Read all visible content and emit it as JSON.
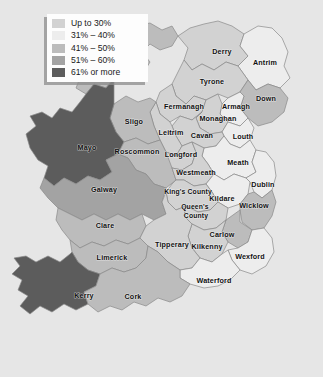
{
  "background_color": "#e6e6e6",
  "legend": {
    "box_color": "#fdfdfd",
    "shadow_color": "#8c8c8c",
    "items": [
      {
        "label": "Up to 30%",
        "color": "#d2d2d2"
      },
      {
        "label": "31% – 40%",
        "color": "#ededed"
      },
      {
        "label": "41% – 50%",
        "color": "#bcbcbc"
      },
      {
        "label": "51% – 60%",
        "color": "#a3a3a3"
      },
      {
        "label": "61% or more",
        "color": "#5c5c5c"
      }
    ]
  },
  "map": {
    "title": "Ireland county choropleth",
    "sea_color": "#e6e6e6",
    "border_color": "#8a8a8a",
    "counties": [
      {
        "name": "Donegal",
        "class": 2,
        "color": "#bcbcbc",
        "x": 92,
        "y": 59
      },
      {
        "name": "Derry",
        "class": 0,
        "color": "#d2d2d2",
        "x": 222,
        "y": 52
      },
      {
        "name": "Antrim",
        "class": 1,
        "color": "#ededed",
        "x": 265,
        "y": 63
      },
      {
        "name": "Tyrone",
        "class": 0,
        "color": "#d2d2d2",
        "x": 212,
        "y": 82
      },
      {
        "name": "Fermanagh",
        "class": 0,
        "color": "#d2d2d2",
        "x": 184,
        "y": 107
      },
      {
        "name": "Armagh",
        "class": 1,
        "color": "#ededed",
        "x": 236,
        "y": 107
      },
      {
        "name": "Down",
        "class": 2,
        "color": "#bcbcbc",
        "x": 266,
        "y": 99
      },
      {
        "name": "Monaghan",
        "class": 0,
        "color": "#d2d2d2",
        "x": 218,
        "y": 119
      },
      {
        "name": "Sligo",
        "class": 2,
        "color": "#bcbcbc",
        "x": 134,
        "y": 122
      },
      {
        "name": "Leitrim",
        "class": 0,
        "color": "#d2d2d2",
        "x": 171,
        "y": 133
      },
      {
        "name": "Cavan",
        "class": 0,
        "color": "#d2d2d2",
        "x": 202,
        "y": 136
      },
      {
        "name": "Louth",
        "class": 1,
        "color": "#ededed",
        "x": 243,
        "y": 137
      },
      {
        "name": "Mayo",
        "class": 4,
        "color": "#5c5c5c",
        "x": 87,
        "y": 148
      },
      {
        "name": "Roscommon",
        "class": 2,
        "color": "#bcbcbc",
        "x": 137,
        "y": 152
      },
      {
        "name": "Longford",
        "class": 0,
        "color": "#d2d2d2",
        "x": 181,
        "y": 155
      },
      {
        "name": "Westmeath",
        "class": 0,
        "color": "#d2d2d2",
        "x": 196,
        "y": 173
      },
      {
        "name": "Meath",
        "class": 1,
        "color": "#ededed",
        "x": 238,
        "y": 163
      },
      {
        "name": "Dublin",
        "class": 1,
        "color": "#ededed",
        "x": 263,
        "y": 185
      },
      {
        "name": "Galway",
        "class": 3,
        "color": "#a3a3a3",
        "x": 104,
        "y": 190
      },
      {
        "name": "King's County",
        "class": 0,
        "color": "#d2d2d2",
        "x": 188,
        "y": 192
      },
      {
        "name": "Kildare",
        "class": 1,
        "color": "#ededed",
        "x": 222,
        "y": 199
      },
      {
        "name": "Wicklow",
        "class": 2,
        "color": "#bcbcbc",
        "x": 254,
        "y": 206
      },
      {
        "name": "Queen's County",
        "class": 0,
        "color": "#d2d2d2",
        "x": 196,
        "y": 211
      },
      {
        "name": "Clare",
        "class": 2,
        "color": "#bcbcbc",
        "x": 105,
        "y": 226
      },
      {
        "name": "Carlow",
        "class": 2,
        "color": "#bcbcbc",
        "x": 222,
        "y": 235
      },
      {
        "name": "Tipperary",
        "class": 0,
        "color": "#d2d2d2",
        "x": 172,
        "y": 245
      },
      {
        "name": "Kilkenny",
        "class": 0,
        "color": "#d2d2d2",
        "x": 207,
        "y": 247
      },
      {
        "name": "Limerick",
        "class": 2,
        "color": "#bcbcbc",
        "x": 112,
        "y": 258
      },
      {
        "name": "Wexford",
        "class": 1,
        "color": "#ededed",
        "x": 250,
        "y": 257
      },
      {
        "name": "Waterford",
        "class": 1,
        "color": "#ededed",
        "x": 214,
        "y": 281
      },
      {
        "name": "Kerry",
        "class": 4,
        "color": "#5c5c5c",
        "x": 84,
        "y": 296
      },
      {
        "name": "Cork",
        "class": 2,
        "color": "#bcbcbc",
        "x": 133,
        "y": 297
      }
    ]
  }
}
